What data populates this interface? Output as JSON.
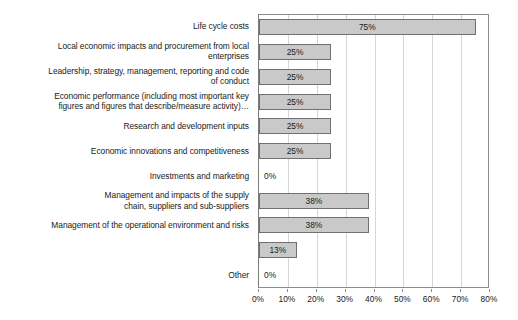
{
  "chart_data": {
    "type": "bar",
    "orientation": "horizontal",
    "title": "",
    "xlabel": "",
    "ylabel": "",
    "xlim": [
      0,
      80
    ],
    "xtick_labels": [
      "0%",
      "10%",
      "20%",
      "30%",
      "40%",
      "50%",
      "60%",
      "70%",
      "80%"
    ],
    "xticks": [
      0,
      10,
      20,
      30,
      40,
      50,
      60,
      70,
      80
    ],
    "grid": true,
    "legend": false,
    "value_suffix": "%",
    "bar_fill_color": "#c9c9c9",
    "bar_border_color": "#707070",
    "gridline_color": "#d6d6d6",
    "axis_color": "#8c8c8c",
    "categories": [
      "Life cycle costs",
      "Local economic impacts and procurement from local\nenterprises",
      "Leadership, strategy, management, reporting and code\nof conduct",
      "Economic performance (including most important key\nfigures and figures that describe/measure activity)…",
      "Research and development inputs",
      "Economic innovations and competitiveness",
      "Investments and marketing",
      "Management and impacts of the supply\nchain, suppliers and sub-suppliers",
      "Management of the operational environment and risks",
      "",
      "Other"
    ],
    "values": [
      75,
      25,
      25,
      25,
      25,
      25,
      0,
      38,
      38,
      13,
      0
    ],
    "value_labels": [
      "75%",
      "25%",
      "25%",
      "25%",
      "25%",
      "25%",
      "0%",
      "38%",
      "38%",
      "13%",
      "0%"
    ]
  }
}
